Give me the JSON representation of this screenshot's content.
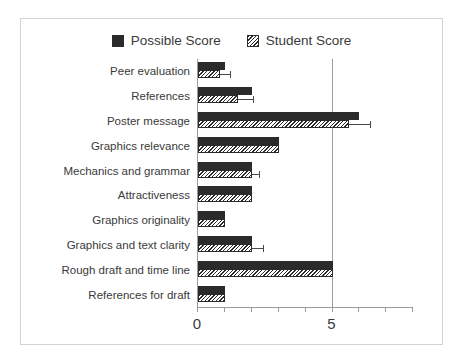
{
  "chart_data": {
    "type": "bar",
    "orientation": "horizontal",
    "title": "",
    "xlabel": "",
    "ylabel": "",
    "xlim": [
      0,
      8
    ],
    "xticks": [
      0,
      1,
      2,
      3,
      4,
      5,
      6,
      7,
      8
    ],
    "xtick_labels": [
      "0",
      "",
      "",
      "",
      "",
      "5",
      "",
      "",
      ""
    ],
    "gridlines": [
      0,
      5
    ],
    "grid": true,
    "legend_position": "top-center",
    "categories": [
      "Peer evaluation",
      "References",
      "Poster message",
      "Graphics relevance",
      "Mechanics and grammar",
      "Attractiveness",
      "Graphics originality",
      "Graphics and text clarity",
      "Rough draft and time line",
      "References for draft"
    ],
    "series": [
      {
        "name": "Possible Score",
        "pattern": "solid",
        "color": "#2b2b2b",
        "values": [
          1,
          2,
          6,
          3,
          2,
          2,
          1,
          2,
          5,
          1
        ]
      },
      {
        "name": "Student Score",
        "pattern": "diagonal-hatch",
        "color": "#2b2b2b",
        "values": [
          0.8,
          1.5,
          5.6,
          3,
          2,
          2,
          1,
          2,
          5,
          1
        ],
        "errors_upper": [
          1.2,
          2.05,
          6.4,
          0,
          2.25,
          0,
          0,
          2.4,
          0,
          0
        ]
      }
    ]
  },
  "legend": {
    "entries": [
      {
        "label": "Possible Score",
        "swatch": "solid-square-icon"
      },
      {
        "label": "Student Score",
        "swatch": "hatched-square-icon"
      }
    ]
  }
}
